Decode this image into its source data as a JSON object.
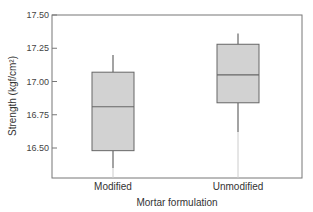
{
  "chart_data": {
    "type": "box",
    "title": "",
    "xlabel": "Mortar formulation",
    "ylabel": "Strength (kgf/cm²)",
    "ylim": [
      16.25,
      17.5
    ],
    "yticks": [
      "17.50",
      "17.25",
      "17.00",
      "16.75",
      "16.50"
    ],
    "categories": [
      "Modified",
      "Unmodified"
    ],
    "series": [
      {
        "name": "Modified",
        "whisker_low": 16.35,
        "q1": 16.48,
        "median": 16.81,
        "q3": 17.07,
        "whisker_high": 17.2
      },
      {
        "name": "Unmodified",
        "whisker_low": 16.62,
        "q1": 16.84,
        "median": 17.05,
        "q3": 17.28,
        "whisker_high": 17.36
      }
    ],
    "grid": false,
    "legend": "none",
    "colors": {
      "box_fill": "#d2d2d2",
      "box_stroke": "#666666",
      "axis": "#666666"
    }
  }
}
